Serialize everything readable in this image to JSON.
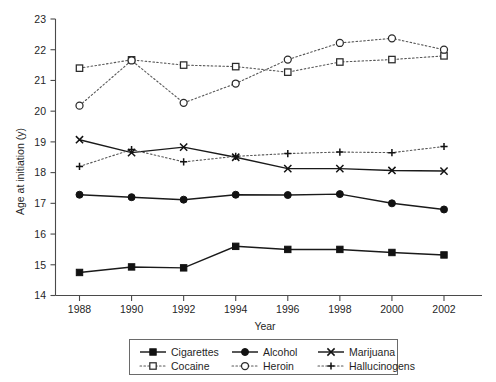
{
  "chart_data": {
    "type": "line",
    "title": "",
    "xlabel": "Year",
    "ylabel": "Age at initiation (y)",
    "x": [
      1988,
      1990,
      1992,
      1994,
      1996,
      1998,
      2000,
      2002
    ],
    "xtick_labels": [
      "1988",
      "1990",
      "1992",
      "1994",
      "1996",
      "1998",
      "2000",
      "2002"
    ],
    "ytick_labels": [
      "14",
      "15",
      "16",
      "17",
      "18",
      "19",
      "20",
      "21",
      "22",
      "23"
    ],
    "ylim": [
      14,
      23
    ],
    "xlim": [
      1987,
      2003
    ],
    "grid": false,
    "legend_position": "below-axes",
    "series": [
      {
        "name": "Cigarettes",
        "marker": "filled-square",
        "line": "solid",
        "values": [
          14.75,
          14.93,
          14.9,
          15.6,
          15.5,
          15.5,
          15.4,
          15.32
        ]
      },
      {
        "name": "Alcohol",
        "marker": "filled-circle",
        "line": "solid",
        "values": [
          17.28,
          17.2,
          17.12,
          17.28,
          17.27,
          17.3,
          17.0,
          16.8
        ]
      },
      {
        "name": "Marijuana",
        "marker": "cross-x",
        "line": "solid",
        "values": [
          19.07,
          18.65,
          18.83,
          18.5,
          18.13,
          18.13,
          18.07,
          18.05
        ]
      },
      {
        "name": "Cocaine",
        "marker": "open-square",
        "line": "dotted",
        "values": [
          21.4,
          21.67,
          21.5,
          21.45,
          21.27,
          21.6,
          21.68,
          21.8
        ]
      },
      {
        "name": "Heroin",
        "marker": "open-circle",
        "line": "dotted",
        "values": [
          20.18,
          21.65,
          20.27,
          20.9,
          21.68,
          22.22,
          22.37,
          22.0
        ]
      },
      {
        "name": "Hallucinogens",
        "marker": "plus",
        "line": "dotted",
        "values": [
          18.2,
          18.75,
          18.35,
          18.53,
          18.62,
          18.67,
          18.65,
          18.85
        ]
      }
    ],
    "legend_entries": [
      {
        "label": "Cigarettes",
        "marker": "filled-square",
        "line": "solid"
      },
      {
        "label": "Alcohol",
        "marker": "filled-circle",
        "line": "solid"
      },
      {
        "label": "Marijuana",
        "marker": "cross-x",
        "line": "solid"
      },
      {
        "label": "Cocaine",
        "marker": "open-square",
        "line": "dotted"
      },
      {
        "label": "Heroin",
        "marker": "open-circle",
        "line": "dotted"
      },
      {
        "label": "Hallucinogens",
        "marker": "plus",
        "line": "dotted"
      }
    ],
    "colors": {
      "line_solid": "#1a1a1a",
      "line_dotted": "#585858",
      "axis": "#4a4a4a",
      "text": "#1f1f1f",
      "background": "#ffffff"
    }
  }
}
